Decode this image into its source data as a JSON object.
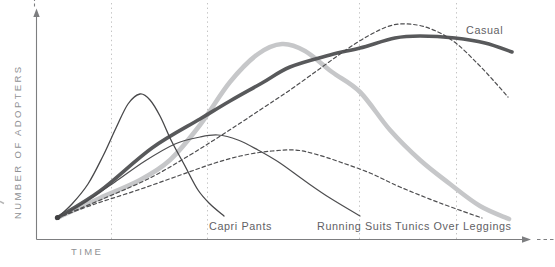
{
  "figure": {
    "y_axis_label": "NUMBER OF ADOPTERS",
    "x_axis_label": "TIME"
  },
  "labels": {
    "casual": "Casual",
    "capri": "Capri Pants",
    "running": "Running Suits",
    "tunics": "Tunics Over Leggings"
  },
  "chart_data": {
    "type": "line",
    "title": "",
    "xlabel": "TIME",
    "ylabel": "NUMBER OF ADOPTERS",
    "axis_ranges": "conceptual, no numeric scale; both axes end in arrows with short dashed continuations",
    "grid": "vertical dotted gridlines only",
    "legend_position": "none (curves labeled inline)",
    "units_note": "points are pixel coordinates in the 555x267 image, y increases downward; origin of all curves at (57,218), x-axis at y=240, y-axis at x=36",
    "gridlines_x_px": [
      111,
      207,
      359,
      456
    ],
    "axis_color": "#7d7e80",
    "gridline_color": "#c4c4c4",
    "label_color": "#5f6165",
    "axis_text_color": "#8f9194",
    "series": [
      {
        "id": "broad-fashion-unlabeled",
        "label": "",
        "description": "thick light-gray fashion curve, unlabeled; rises steeply, peaks about x=280, falls to baseline at far right",
        "style": "solid",
        "color": "#c6c7c9",
        "width": 4.6,
        "points": [
          [
            57,
            218
          ],
          [
            100,
            198
          ],
          [
            140,
            180
          ],
          [
            170,
            160
          ],
          [
            200,
            125
          ],
          [
            230,
            82
          ],
          [
            258,
            54
          ],
          [
            282,
            44
          ],
          [
            305,
            51
          ],
          [
            332,
            72
          ],
          [
            360,
            92
          ],
          [
            390,
            130
          ],
          [
            420,
            160
          ],
          [
            450,
            184
          ],
          [
            480,
            206
          ],
          [
            509,
            219
          ]
        ]
      },
      {
        "id": "casual",
        "label": "Casual",
        "description": "thick dark-gray classic curve; long slow rise, broad flat peak near x=410, slight decline at right edge",
        "style": "solid",
        "color": "#58595b",
        "width": 3.6,
        "points": [
          [
            57,
            218
          ],
          [
            100,
            191
          ],
          [
            152,
            148
          ],
          [
            200,
            119
          ],
          [
            230,
            101
          ],
          [
            262,
            83
          ],
          [
            290,
            67
          ],
          [
            330,
            55
          ],
          [
            360,
            48
          ],
          [
            395,
            38
          ],
          [
            420,
            36
          ],
          [
            455,
            38
          ],
          [
            485,
            43
          ],
          [
            512,
            52
          ]
        ]
      },
      {
        "id": "tall-dashed-unlabeled",
        "label": "",
        "description": "thin dashed curve, unlabeled; hugs below the thick pair then peaks highest near x=395 and drops steeply",
        "style": "dashed",
        "color": "#4e4e50",
        "width": 1.2,
        "points": [
          [
            57,
            218
          ],
          [
            105,
            198
          ],
          [
            150,
            178
          ],
          [
            190,
            155
          ],
          [
            225,
            133
          ],
          [
            260,
            110
          ],
          [
            290,
            90
          ],
          [
            318,
            70
          ],
          [
            343,
            52
          ],
          [
            368,
            36
          ],
          [
            393,
            25
          ],
          [
            417,
            25
          ],
          [
            438,
            32
          ],
          [
            457,
            44
          ],
          [
            477,
            63
          ],
          [
            493,
            80
          ],
          [
            508,
            97
          ]
        ]
      },
      {
        "id": "tunics-over-leggings",
        "label": "Tunics Over Leggings",
        "description": "thin dashed low broad curve; gentle rise, low peak near x=285, gentle fall ending above its label",
        "style": "dashed",
        "color": "#4e4e50",
        "width": 1.2,
        "points": [
          [
            57,
            218
          ],
          [
            95,
            204
          ],
          [
            135,
            191
          ],
          [
            175,
            177
          ],
          [
            215,
            163
          ],
          [
            245,
            155
          ],
          [
            272,
            151
          ],
          [
            295,
            150
          ],
          [
            315,
            154
          ],
          [
            340,
            162
          ],
          [
            370,
            173
          ],
          [
            400,
            187
          ],
          [
            440,
            203
          ],
          [
            482,
            218
          ]
        ]
      },
      {
        "id": "running-suits",
        "label": "Running Suits",
        "description": "thin solid medium bell; peaks near x=218 then declines to baseline above its label",
        "style": "solid",
        "color": "#4e4e50",
        "width": 1.2,
        "points": [
          [
            57,
            218
          ],
          [
            85,
            202
          ],
          [
            115,
            182
          ],
          [
            145,
            161
          ],
          [
            175,
            144
          ],
          [
            200,
            137
          ],
          [
            218,
            135
          ],
          [
            238,
            140
          ],
          [
            258,
            150
          ],
          [
            280,
            163
          ],
          [
            305,
            181
          ],
          [
            330,
            198
          ],
          [
            360,
            216
          ]
        ]
      },
      {
        "id": "capri-pants",
        "label": "Capri Pants",
        "description": "thin solid narrow fad bell; sharp peak near x=140, back to baseline above its label",
        "style": "solid",
        "color": "#48484a",
        "width": 1.3,
        "points": [
          [
            57,
            218
          ],
          [
            72,
            204
          ],
          [
            88,
            184
          ],
          [
            103,
            156
          ],
          [
            116,
            128
          ],
          [
            128,
            104
          ],
          [
            140,
            94
          ],
          [
            150,
            100
          ],
          [
            160,
            116
          ],
          [
            172,
            142
          ],
          [
            185,
            166
          ],
          [
            198,
            190
          ],
          [
            210,
            204
          ],
          [
            224,
            216
          ]
        ]
      }
    ]
  }
}
